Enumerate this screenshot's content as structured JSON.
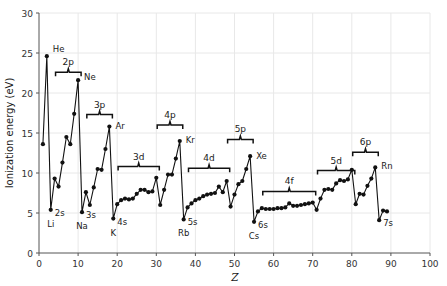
{
  "chart_data": {
    "type": "line",
    "title": "",
    "xlabel": "Z",
    "ylabel": "Ionization energy (eV)",
    "xlim": [
      0,
      100
    ],
    "ylim": [
      0,
      30
    ],
    "xticks": [
      0,
      10,
      20,
      30,
      40,
      50,
      60,
      70,
      80,
      90,
      100
    ],
    "yticks": [
      0,
      5,
      10,
      15,
      20,
      25,
      30
    ],
    "grid": true,
    "legend": "none",
    "marker": "filled-circle",
    "line_color": "#111111",
    "marker_color": "#111111",
    "grid_color": "#e8e8e8",
    "x": [
      1,
      2,
      3,
      4,
      5,
      6,
      7,
      8,
      9,
      10,
      11,
      12,
      13,
      14,
      15,
      16,
      17,
      18,
      19,
      20,
      21,
      22,
      23,
      24,
      25,
      26,
      27,
      28,
      29,
      30,
      31,
      32,
      33,
      34,
      35,
      36,
      37,
      38,
      39,
      40,
      41,
      42,
      43,
      44,
      45,
      46,
      47,
      48,
      49,
      50,
      51,
      52,
      53,
      54,
      55,
      56,
      57,
      58,
      59,
      60,
      61,
      62,
      63,
      64,
      65,
      66,
      67,
      68,
      69,
      70,
      71,
      72,
      73,
      74,
      75,
      76,
      77,
      78,
      79,
      80,
      81,
      82,
      83,
      84,
      85,
      86,
      87,
      88,
      89
    ],
    "values": [
      13.6,
      24.6,
      5.4,
      9.3,
      8.3,
      11.3,
      14.5,
      13.6,
      17.4,
      21.6,
      5.1,
      7.6,
      6.0,
      8.2,
      10.5,
      10.4,
      13.0,
      15.8,
      4.3,
      6.1,
      6.6,
      6.8,
      6.7,
      6.8,
      7.4,
      7.9,
      7.9,
      7.6,
      7.7,
      9.4,
      6.0,
      7.9,
      9.8,
      9.8,
      11.8,
      14.0,
      4.2,
      5.7,
      6.2,
      6.6,
      6.8,
      7.1,
      7.3,
      7.4,
      7.5,
      8.3,
      7.6,
      9.0,
      5.8,
      7.3,
      8.6,
      9.0,
      10.5,
      12.1,
      3.9,
      5.2,
      5.6,
      5.5,
      5.5,
      5.5,
      5.6,
      5.6,
      5.7,
      6.2,
      5.9,
      5.9,
      6.0,
      6.1,
      6.2,
      6.3,
      5.4,
      6.8,
      7.9,
      8.0,
      7.9,
      8.7,
      9.1,
      9.0,
      9.2,
      10.4,
      6.1,
      7.4,
      7.3,
      8.4,
      9.3,
      10.7,
      4.1,
      5.3,
      5.2
    ],
    "element_labels": [
      {
        "text": "He",
        "z": 2,
        "e": 24.6
      },
      {
        "text": "Ne",
        "z": 10,
        "e": 21.6
      },
      {
        "text": "Ar",
        "z": 18,
        "e": 15.8
      },
      {
        "text": "Kr",
        "z": 36,
        "e": 14.0
      },
      {
        "text": "Xe",
        "z": 54,
        "e": 12.1
      },
      {
        "text": "Rn",
        "z": 86,
        "e": 10.7
      },
      {
        "text": "Li",
        "z": 3,
        "e": 5.4
      },
      {
        "text": "Na",
        "z": 11,
        "e": 5.1
      },
      {
        "text": "K",
        "z": 19,
        "e": 4.3
      },
      {
        "text": "Rb",
        "z": 37,
        "e": 4.2
      },
      {
        "text": "Cs",
        "z": 55,
        "e": 3.9
      }
    ],
    "orbital_labels": [
      {
        "text": "2s",
        "z": 3,
        "e": 5.4
      },
      {
        "text": "3s",
        "z": 11,
        "e": 5.1
      },
      {
        "text": "4s",
        "z": 19,
        "e": 4.3
      },
      {
        "text": "5s",
        "z": 37,
        "e": 4.2
      },
      {
        "text": "6s",
        "z": 55,
        "e": 3.9
      },
      {
        "text": "7s",
        "z": 87,
        "e": 4.1
      }
    ],
    "shell_brackets": [
      {
        "label": "2p",
        "z_start": 5,
        "z_end": 10,
        "e": 22.6
      },
      {
        "label": "3p",
        "z_start": 13,
        "z_end": 18,
        "e": 17.3
      },
      {
        "label": "3d",
        "z_start": 21,
        "z_end": 30,
        "e": 10.8
      },
      {
        "label": "4p",
        "z_start": 31,
        "z_end": 36,
        "e": 16.0
      },
      {
        "label": "4d",
        "z_start": 39,
        "z_end": 48,
        "e": 10.6
      },
      {
        "label": "5p",
        "z_start": 49,
        "z_end": 54,
        "e": 14.2
      },
      {
        "label": "4f",
        "z_start": 58,
        "z_end": 70,
        "e": 7.7
      },
      {
        "label": "5d",
        "z_start": 72,
        "z_end": 80,
        "e": 10.3
      },
      {
        "label": "6p",
        "z_start": 81,
        "z_end": 86,
        "e": 12.6
      }
    ]
  }
}
